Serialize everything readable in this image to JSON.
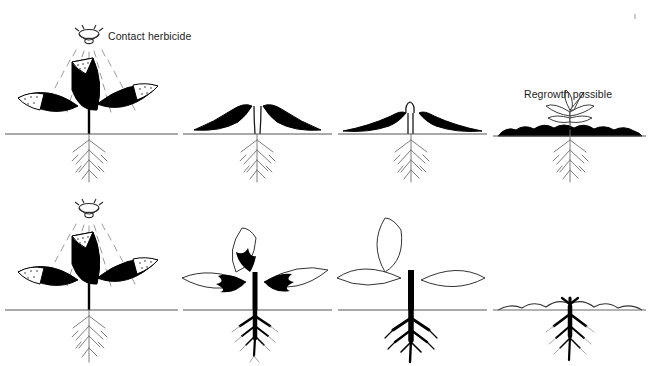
{
  "figure": {
    "background_color": "#ffffff",
    "ink_color": "#000000",
    "text_color": "#1c1c1c"
  },
  "rows": [
    {
      "id": "contact",
      "label": "Contact herbicide",
      "icon": "spray-nozzle-icon",
      "annotation": "Regrowth possible",
      "panels": [
        {
          "stage": 1,
          "caption_text": "",
          "leaves_treated": true,
          "stem_black": false,
          "roots_black": false,
          "spray_visible": true
        },
        {
          "stage": 2,
          "caption_text": "",
          "leaves_treated": true,
          "stem_black": false,
          "roots_black": false,
          "spray_visible": false
        },
        {
          "stage": 3,
          "caption_text": "",
          "leaves_treated": true,
          "stem_black": false,
          "roots_black": false,
          "spray_visible": false
        },
        {
          "stage": 4,
          "caption_text": "",
          "leaves_treated": false,
          "stem_black": false,
          "roots_black": false,
          "spray_visible": false
        }
      ]
    },
    {
      "id": "systemic",
      "label": "Systemic herbicide",
      "icon": "spray-nozzle-icon",
      "annotation": "",
      "panels": [
        {
          "stage": 1,
          "caption_text": "",
          "leaves_treated": true,
          "stem_black": false,
          "roots_black": false,
          "spray_visible": true
        },
        {
          "stage": 2,
          "caption_text": "",
          "leaves_treated": true,
          "stem_black": true,
          "roots_black": true,
          "spray_visible": false
        },
        {
          "stage": 3,
          "caption_text": "",
          "leaves_treated": true,
          "stem_black": true,
          "roots_black": true,
          "spray_visible": false
        },
        {
          "stage": 4,
          "caption_text": "",
          "leaves_treated": true,
          "stem_black": true,
          "roots_black": true,
          "spray_visible": false
        }
      ]
    }
  ],
  "labels": {
    "contact": "Contact herbicide",
    "systemic": "Systemic herbicide",
    "regrowth": "Regrowth possible"
  }
}
